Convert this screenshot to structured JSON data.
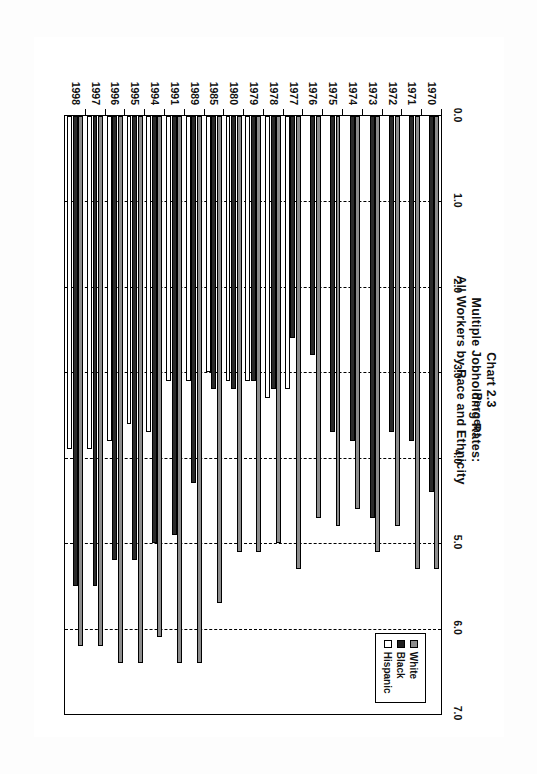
{
  "document": {
    "background_color": "#fdfdfd"
  },
  "chart_data": {
    "type": "bar",
    "orientation": "horizontal",
    "title": "Chart 2.3",
    "subtitle_line1": "Multiple Jobholding Rates:",
    "subtitle_line2": "All Workers by Race and Ethnicity",
    "xlabel": "Percent",
    "ylabel": "",
    "xlim": [
      0.0,
      7.0
    ],
    "xticks": [
      0.0,
      1.0,
      2.0,
      3.0,
      4.0,
      5.0,
      6.0,
      7.0
    ],
    "xtick_labels": [
      "0.0",
      "1.0",
      "2.0",
      "3.0",
      "4.0",
      "5.0",
      "6.0",
      "7.0"
    ],
    "grid": true,
    "grid_style": "dashed",
    "legend_position": "upper right",
    "categories": [
      "1970",
      "1971",
      "1972",
      "1973",
      "1974",
      "1975",
      "1976",
      "1977",
      "1978",
      "1979",
      "1980",
      "1985",
      "1989",
      "1991",
      "1994",
      "1995",
      "1996",
      "1997",
      "1998"
    ],
    "series": [
      {
        "name": "White",
        "color": "#8c8c8c",
        "values": [
          5.3,
          5.3,
          4.8,
          5.1,
          4.6,
          4.8,
          4.7,
          5.3,
          5.0,
          5.1,
          5.1,
          5.7,
          6.4,
          6.4,
          6.1,
          6.4,
          6.4,
          6.2,
          6.2
        ]
      },
      {
        "name": "Black",
        "color": "#2a2a2a",
        "values": [
          4.4,
          3.8,
          3.7,
          4.7,
          3.8,
          3.7,
          2.8,
          2.6,
          3.2,
          3.1,
          3.2,
          3.2,
          4.3,
          4.9,
          5.0,
          5.2,
          5.2,
          5.5,
          5.5
        ]
      },
      {
        "name": "Hispanic",
        "color": "#ffffff",
        "values": [
          0,
          0,
          0,
          0,
          0,
          0,
          0,
          3.2,
          3.3,
          3.1,
          3.1,
          3.0,
          3.1,
          3.1,
          3.7,
          3.6,
          3.8,
          3.9,
          3.9
        ]
      }
    ]
  },
  "legend": {
    "items": [
      {
        "label": "White"
      },
      {
        "label": "Black"
      },
      {
        "label": "Hispanic"
      }
    ]
  }
}
